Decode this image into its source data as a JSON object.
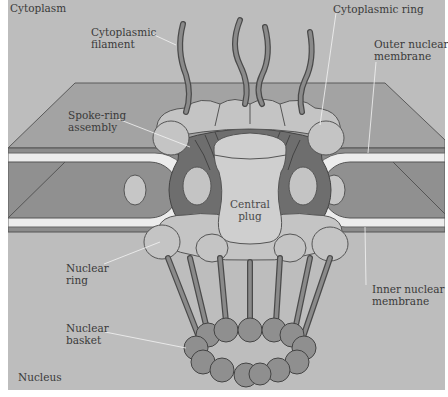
{
  "figure": {
    "regions": {
      "top": "Cytoplasm",
      "bottom": "Nucleus"
    },
    "labels": [
      {
        "id": "cytoplasmic-filament",
        "lines": [
          "Cytoplasmic",
          "filament"
        ]
      },
      {
        "id": "cytoplasmic-ring",
        "lines": [
          "Cytoplasmic ring"
        ]
      },
      {
        "id": "outer-nuclear-membrane",
        "lines": [
          "Outer nuclear",
          "membrane"
        ]
      },
      {
        "id": "spoke-ring-assembly",
        "lines": [
          "Spoke-ring",
          "assembly"
        ]
      },
      {
        "id": "central-plug",
        "lines": [
          "Central",
          "plug"
        ]
      },
      {
        "id": "nuclear-ring",
        "lines": [
          "Nuclear",
          "ring"
        ]
      },
      {
        "id": "inner-nuclear-membrane",
        "lines": [
          "Inner nuclear",
          "membrane"
        ]
      },
      {
        "id": "nuclear-basket",
        "lines": [
          "Nuclear",
          "basket"
        ]
      }
    ],
    "colors": {
      "background": "#bdbdbd",
      "membrane_top": "#9e9e9e",
      "membrane_gap": "#8a8a8a",
      "membrane_white": "#ececec",
      "protein_light": "#c9c9c9",
      "protein_dark": "#6e6e6e",
      "basket_ball": "#8f8f8f",
      "outline": "#4a4a4a",
      "text": "#3a3a3a"
    }
  }
}
